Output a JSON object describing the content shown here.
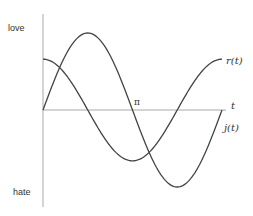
{
  "chart_data": {
    "type": "line",
    "title": "",
    "xlabel": "t",
    "ylabel": "",
    "y_tick_labels": {
      "top": "love",
      "bottom": "hate"
    },
    "x_tick_labels": [
      {
        "value": 3.14159,
        "label": "π"
      }
    ],
    "xlim": [
      0,
      6.2832
    ],
    "ylim": [
      -1.3,
      1.25
    ],
    "grid": false,
    "legend": "inline labels at right end of curves",
    "series": [
      {
        "name": "r(t)",
        "label_position": "upper right",
        "shape": "sine-like, starts at 0, peak near π/2, crosses 0 at π, trough near 3π/2, returns to 0 at 2π",
        "amplitude": 1.0,
        "x": [
          0,
          0.7854,
          1.5708,
          2.3562,
          3.1416,
          3.927,
          4.7124,
          5.4978,
          6.2832
        ],
        "values": [
          0,
          0.71,
          1.0,
          0.71,
          0,
          -0.71,
          -1.0,
          -0.71,
          0
        ]
      },
      {
        "name": "j(t)",
        "label_position": "lower right",
        "shape": "cosine-like, starts at 0.66, crosses 0 at π/2, trough at π, crosses 0 at 3π/2, returns to 0.66 at 2π",
        "amplitude": 0.66,
        "x": [
          0,
          0.7854,
          1.5708,
          2.3562,
          3.1416,
          3.927,
          4.7124,
          5.4978,
          6.2832
        ],
        "values": [
          0.66,
          0.47,
          0,
          -0.47,
          -0.66,
          -0.47,
          0,
          0.47,
          0.66
        ]
      }
    ]
  },
  "labels": {
    "y_top": "love",
    "y_bottom": "hate",
    "x_axis": "t",
    "pi": "π",
    "series_r": "r(t)",
    "series_j": "j(t)"
  },
  "colors": {
    "curve": "#444444",
    "axis": "#a0a0a0",
    "text": "#333333"
  }
}
